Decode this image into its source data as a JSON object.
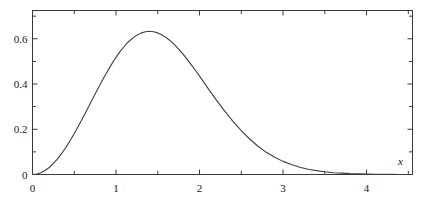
{
  "figure": {
    "background_color": "#ffffff",
    "frame_color": "#3a3a3a",
    "curve_color": "#404040"
  },
  "axis_labels": {
    "x_name": "x",
    "y_name": ""
  },
  "x_ticks": [
    {
      "value": 0,
      "label": "0",
      "major": true
    },
    {
      "value": 0.5,
      "label": "",
      "major": false
    },
    {
      "value": 1,
      "label": "1",
      "major": true
    },
    {
      "value": 1.5,
      "label": "",
      "major": false
    },
    {
      "value": 2,
      "label": "2",
      "major": true
    },
    {
      "value": 2.5,
      "label": "",
      "major": false
    },
    {
      "value": 3,
      "label": "3",
      "major": true
    },
    {
      "value": 3.5,
      "label": "",
      "major": false
    },
    {
      "value": 4,
      "label": "4",
      "major": true
    },
    {
      "value": 4.5,
      "label": "",
      "major": false
    }
  ],
  "y_ticks": [
    {
      "value": 0,
      "label": "0",
      "major": true
    },
    {
      "value": 0.1,
      "label": "",
      "major": false
    },
    {
      "value": 0.2,
      "label": "0.2",
      "major": true
    },
    {
      "value": 0.3,
      "label": "",
      "major": false
    },
    {
      "value": 0.4,
      "label": "0.4",
      "major": true
    },
    {
      "value": 0.5,
      "label": "",
      "major": false
    },
    {
      "value": 0.6,
      "label": "0.6",
      "major": true
    },
    {
      "value": 0.7,
      "label": "",
      "major": false
    }
  ],
  "chart_data": {
    "type": "line",
    "title": "",
    "subtitle": "",
    "xlabel": "x",
    "ylabel": "",
    "xlim": [
      0,
      4.55
    ],
    "ylim": [
      0,
      0.725
    ],
    "grid": false,
    "legend": null,
    "annotations": [],
    "xticks": [
      0,
      0.5,
      1,
      1.5,
      2,
      2.5,
      3,
      3.5,
      4,
      4.5
    ],
    "xticklabels": [
      "0",
      "",
      "1",
      "",
      "2",
      "",
      "3",
      "",
      "4",
      ""
    ],
    "yticks": [
      0,
      0.1,
      0.2,
      0.3,
      0.4,
      0.5,
      0.6,
      0.7
    ],
    "yticklabels": [
      "0",
      "",
      "0.2",
      "",
      "0.4",
      "",
      "0.6",
      ""
    ],
    "peak": {
      "x": 1.414,
      "y": 0.5844
    },
    "series": [
      {
        "name": "maxwell-boltzmann-pdf",
        "color": "#404040",
        "x": [
          0.0,
          0.05,
          0.1,
          0.15,
          0.2,
          0.25,
          0.3,
          0.35,
          0.4,
          0.45,
          0.5,
          0.55,
          0.6,
          0.65,
          0.7,
          0.75,
          0.8,
          0.85,
          0.9,
          0.95,
          1.0,
          1.05,
          1.1,
          1.15,
          1.2,
          1.25,
          1.3,
          1.35,
          1.4,
          1.45,
          1.5,
          1.55,
          1.6,
          1.65,
          1.7,
          1.75,
          1.8,
          1.85,
          1.9,
          1.95,
          2.0,
          2.1,
          2.2,
          2.3,
          2.4,
          2.5,
          2.6,
          2.7,
          2.8,
          2.9,
          3.0,
          3.1,
          3.2,
          3.3,
          3.4,
          3.5,
          3.6,
          3.7,
          3.8,
          3.9,
          4.0,
          4.1,
          4.2,
          4.3,
          4.4,
          4.5
        ],
        "y": [
          0.0,
          0.002,
          0.008,
          0.018,
          0.031,
          0.049,
          0.069,
          0.093,
          0.12,
          0.149,
          0.181,
          0.214,
          0.249,
          0.284,
          0.32,
          0.356,
          0.391,
          0.425,
          0.458,
          0.489,
          0.518,
          0.544,
          0.567,
          0.587,
          0.603,
          0.616,
          0.625,
          0.631,
          0.633,
          0.631,
          0.626,
          0.617,
          0.605,
          0.591,
          0.574,
          0.554,
          0.533,
          0.51,
          0.486,
          0.461,
          0.435,
          0.382,
          0.33,
          0.281,
          0.235,
          0.194,
          0.157,
          0.125,
          0.098,
          0.076,
          0.058,
          0.044,
          0.032,
          0.023,
          0.017,
          0.012,
          0.008,
          0.006,
          0.004,
          0.003,
          0.002,
          0.001,
          0.001,
          0.0005,
          0.0003,
          0.0002
        ]
      }
    ]
  }
}
